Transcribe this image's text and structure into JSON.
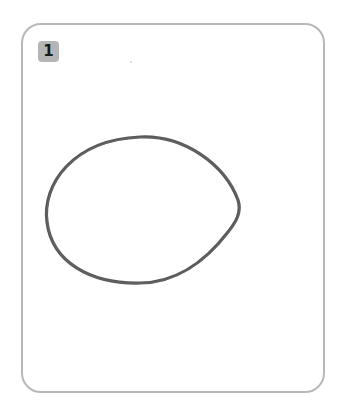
{
  "card": {
    "badge_label": "1",
    "figure": {
      "shape": "egg-oval",
      "style": "pencil-outline",
      "stroke_color": "#3a3a3a"
    },
    "border_color": "#b8b8b8",
    "badge_color": "#b5b5b5"
  }
}
